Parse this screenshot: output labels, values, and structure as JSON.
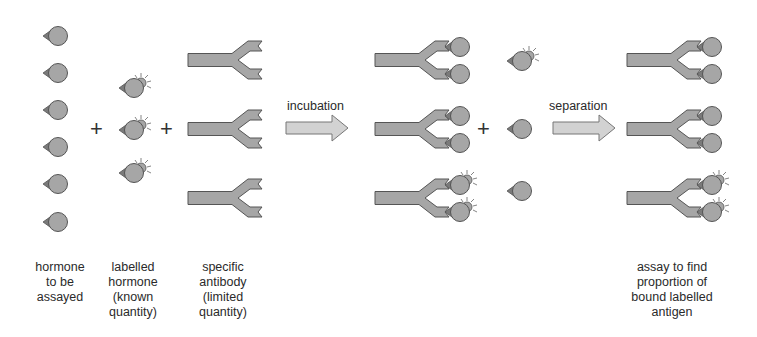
{
  "colors": {
    "fill": "#a6a6a6",
    "stroke": "#555555",
    "tag": "#7a7a7a",
    "arrow_fill": "#d2d2d2",
    "text": "#2a2a2a",
    "background": "#ffffff"
  },
  "icons": {
    "hormone": "hormone-molecule-icon",
    "labelled_hormone": "labelled-hormone-molecule-icon",
    "antibody": "y-shaped-antibody-icon",
    "arrow": "right-arrow-icon",
    "plus": "plus-sign"
  },
  "operators": {
    "plus_1": "+",
    "plus_2": "+",
    "plus_3": "+"
  },
  "steps": {
    "incubation": "incubation",
    "separation": "separation"
  },
  "labels": {
    "hormone_to_be_assayed": "hormone\nto be\nassayed",
    "labelled_hormone": "labelled\nhormone\n(known\nquantity)",
    "specific_antibody": "specific\nantibody\n(limited\nquantity)",
    "assay_result": "assay to find\nproportion of\nbound labelled\nantigen"
  },
  "groups": {
    "hormones": {
      "count": 6,
      "x": 58,
      "y": [
        36,
        73,
        110,
        147,
        184,
        222
      ]
    },
    "labelled_hormones": {
      "count": 3,
      "x": 133,
      "y": [
        87,
        129,
        172
      ]
    },
    "antibodies": {
      "count": 3,
      "x": 188,
      "y": [
        60,
        129,
        198
      ]
    },
    "after_incubation": {
      "antibodies": [
        {
          "y": 60,
          "bound": [
            "hormone",
            "hormone"
          ]
        },
        {
          "y": 129,
          "bound": [
            "hormone",
            "hormone"
          ]
        },
        {
          "y": 198,
          "bound": [
            "labelled",
            "labelled"
          ]
        }
      ],
      "free": [
        {
          "y": 60,
          "type": "labelled"
        },
        {
          "y": 129,
          "type": "hormone"
        },
        {
          "y": 190,
          "type": "hormone"
        }
      ]
    },
    "after_separation": {
      "antibodies": [
        {
          "y": 60,
          "bound": [
            "hormone",
            "hormone"
          ]
        },
        {
          "y": 129,
          "bound": [
            "hormone",
            "hormone"
          ]
        },
        {
          "y": 198,
          "bound": [
            "labelled",
            "labelled"
          ]
        }
      ]
    }
  }
}
